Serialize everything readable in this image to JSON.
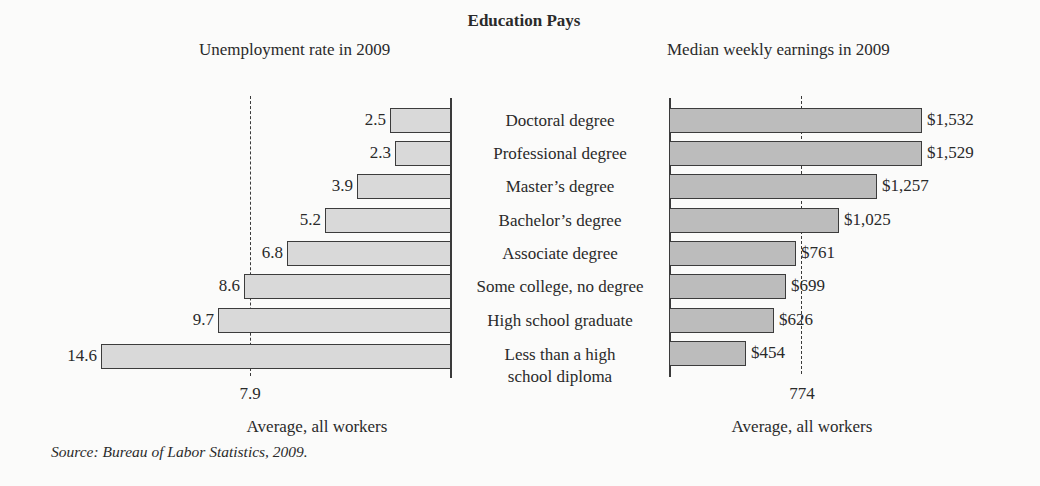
{
  "chart_data": [
    {
      "type": "bar",
      "orientation": "horizontal",
      "direction": "right-to-left",
      "title": "Unemployment rate in 2009",
      "categories": [
        "Doctoral degree",
        "Professional degree",
        "Master’s degree",
        "Bachelor’s degree",
        "Associate degree",
        "Some college, no degree",
        "High school graduate",
        "Less than a high school diploma"
      ],
      "values": [
        2.5,
        2.3,
        3.9,
        5.2,
        6.8,
        8.6,
        9.7,
        14.6
      ],
      "value_labels": [
        "2.5",
        "2.3",
        "3.9",
        "5.2",
        "6.8",
        "8.6",
        "9.7",
        "14.6"
      ],
      "reference_line": {
        "value": 7.9,
        "label": "7.9",
        "caption": "Average, all workers",
        "style": "dashed"
      },
      "unit": "percent",
      "grid": false,
      "bar_color": "#d9d9d9"
    },
    {
      "type": "bar",
      "orientation": "horizontal",
      "direction": "left-to-right",
      "title": "Median weekly earnings in 2009",
      "categories": [
        "Doctoral degree",
        "Professional degree",
        "Master’s degree",
        "Bachelor’s degree",
        "Associate degree",
        "Some college, no degree",
        "High school graduate",
        "Less than a high school diploma"
      ],
      "values": [
        1532,
        1529,
        1257,
        1025,
        761,
        699,
        626,
        454
      ],
      "value_labels": [
        "$1,532",
        "$1,529",
        "$1,257",
        "$1,025",
        "$761",
        "$699",
        "$626",
        "$454"
      ],
      "reference_line": {
        "value": 774,
        "label": "774",
        "caption": "Average, all workers",
        "style": "dashed"
      },
      "unit": "USD per week",
      "grid": false,
      "bar_color": "#bcbcbc"
    }
  ],
  "figure": {
    "title": "Education Pays",
    "source": "Source: Bureau of Labor Statistics, 2009."
  },
  "left": {
    "title": "Unemployment rate in 2009",
    "avg_value": "7.9",
    "avg_label": "Average, all workers",
    "rows": [
      {
        "label": "2.5",
        "x": 390,
        "top": 108
      },
      {
        "label": "2.3",
        "x": 395,
        "top": 141
      },
      {
        "label": "3.9",
        "x": 357,
        "top": 174
      },
      {
        "label": "5.2",
        "x": 325,
        "top": 208
      },
      {
        "label": "6.8",
        "x": 287,
        "top": 241
      },
      {
        "label": "8.6",
        "x": 244,
        "top": 274
      },
      {
        "label": "9.7",
        "x": 218,
        "top": 308
      },
      {
        "label": "14.6",
        "x": 101,
        "top": 344
      }
    ]
  },
  "center": {
    "categories": [
      "Doctoral degree",
      "Professional degree",
      "Master’s degree",
      "Bachelor’s degree",
      "Associate degree",
      "Some college, no degree",
      "High school graduate",
      "Less than a high",
      "school diploma"
    ]
  },
  "right": {
    "title": "Median weekly earnings in 2009",
    "avg_value": "774",
    "avg_label": "Average, all workers",
    "rows": [
      {
        "label": "$1,532",
        "x": 922,
        "top": 108
      },
      {
        "label": "$1,529",
        "x": 922,
        "top": 141
      },
      {
        "label": "$1,257",
        "x": 877,
        "top": 174
      },
      {
        "label": "$1,025",
        "x": 839,
        "top": 208
      },
      {
        "label": "$761",
        "x": 796,
        "top": 241
      },
      {
        "label": "$699",
        "x": 786,
        "top": 274
      },
      {
        "label": "$626",
        "x": 774,
        "top": 308
      },
      {
        "label": "$454",
        "x": 746,
        "top": 341
      }
    ]
  }
}
